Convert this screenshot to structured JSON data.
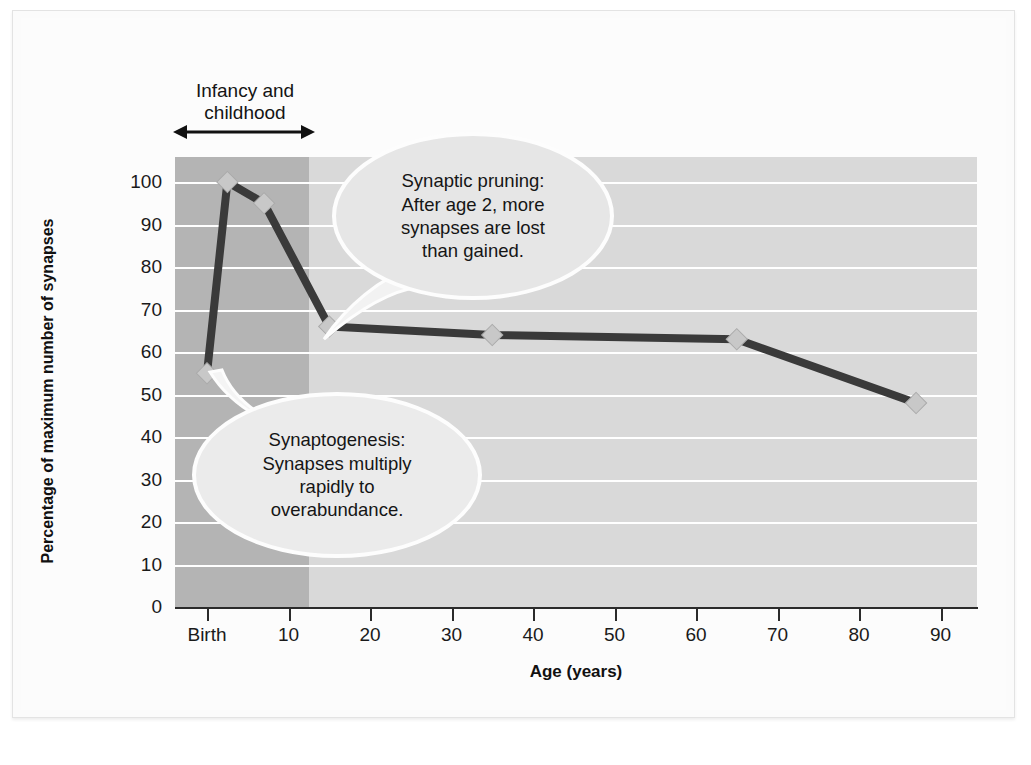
{
  "figure": {
    "caption_alt": "Synapse density across the human lifespan"
  },
  "annotations": {
    "infancy_label": "Infancy  and\nchildhood",
    "callout_pruning": "Synaptic pruning:\nAfter age 2, more\nsynapses are lost\nthan gained.",
    "callout_synaptogenesis": "Synaptogenesis:\nSynapses multiply\nrapidly to\noverabundance."
  },
  "colors": {
    "plot_background": "#d9d9d9",
    "infancy_band": "#b4b4b4",
    "gridline": "#ffffff",
    "line": "#3a3a3a",
    "marker_fill": "#c8c8c8",
    "axis": "#2b2b2b",
    "callout_fill": "#e6e6e6",
    "callout_border": "#fdfdfd"
  },
  "chart_data": {
    "type": "line",
    "title": "",
    "xlabel": "Age (years)",
    "ylabel": "Percentage of maximum number of synapses",
    "xlim": [
      0,
      98
    ],
    "ylim": [
      0,
      105
    ],
    "grid": true,
    "legend": "none",
    "x_tick_labels": [
      "Birth",
      "10",
      "20",
      "30",
      "40",
      "50",
      "60",
      "70",
      "80",
      "90"
    ],
    "x_tick_values": [
      0,
      10,
      20,
      30,
      40,
      50,
      60,
      70,
      80,
      90
    ],
    "y_tick_labels": [
      "0",
      "10",
      "20",
      "30",
      "40",
      "50",
      "60",
      "70",
      "80",
      "90",
      "100"
    ],
    "y_tick_values": [
      0,
      10,
      20,
      30,
      40,
      50,
      60,
      70,
      80,
      90,
      100
    ],
    "series": [
      {
        "name": "Percentage of maximum number of synapses",
        "x": [
          0,
          2.5,
          7,
          15,
          35,
          65,
          87
        ],
        "values": [
          55,
          100,
          95,
          66,
          64,
          63,
          48
        ]
      }
    ],
    "shaded_regions": [
      {
        "label": "Infancy and childhood",
        "x_start": 0,
        "x_end": 12.5
      }
    ]
  }
}
